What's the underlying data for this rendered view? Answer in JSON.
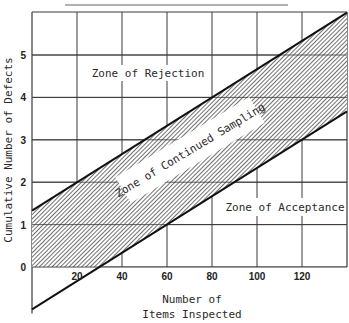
{
  "chart_data": {
    "type": "line",
    "title": "",
    "xlabel": [
      "Number of",
      "Items Inspected"
    ],
    "ylabel": "Cumulative Number of Defects",
    "xlim": [
      0,
      140
    ],
    "ylim": [
      -1,
      6
    ],
    "x_ticks": [
      20,
      40,
      60,
      80,
      100,
      120
    ],
    "x_tick_labels": [
      "20",
      "40",
      "60",
      "80",
      "100",
      "120"
    ],
    "y_ticks": [
      0,
      1,
      2,
      3,
      4,
      5
    ],
    "y_tick_labels": [
      "0",
      "1",
      "2",
      "3",
      "4",
      "5"
    ],
    "grid": true,
    "series": [
      {
        "name": "Rejection line",
        "x": [
          0,
          140
        ],
        "y": [
          1.33,
          6.0
        ],
        "slope": 0.0333,
        "intercept": 1.33
      },
      {
        "name": "Acceptance line",
        "x": [
          0,
          140
        ],
        "y": [
          -1.0,
          3.67
        ],
        "slope": 0.0333,
        "intercept": -1.0
      }
    ],
    "regions": [
      {
        "name": "Zone of Rejection",
        "position": "above upper line"
      },
      {
        "name": "Zone of Continued Sampling",
        "position": "between lines (hatched)"
      },
      {
        "name": "Zone of Acceptance",
        "position": "below lower line"
      }
    ],
    "annotations": [
      "Zone of Rejection",
      "Zone of Continued Sampling",
      "Zone of Acceptance"
    ]
  },
  "labels": {
    "zone_rejection": "Zone of Rejection",
    "zone_continued": "Zone of Continued Sampling",
    "zone_acceptance": "Zone of Acceptance",
    "xlabel_line1": "Number of",
    "xlabel_line2": "Items Inspected",
    "ylabel": "Cumulative Number of Defects"
  },
  "colors": {
    "ink": "#222222",
    "grid": "#3a3a3a",
    "background": "#ffffff"
  }
}
